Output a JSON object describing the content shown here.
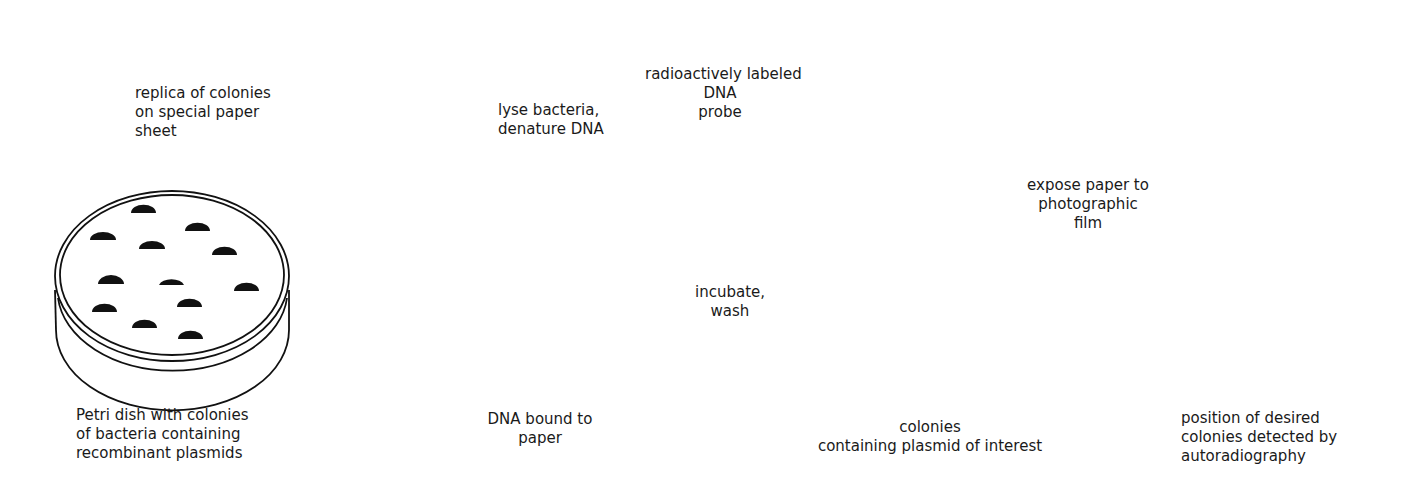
{
  "colors": {
    "ink": "#111111",
    "background": "#ffffff"
  },
  "steps": [
    {
      "id": "petri-dish",
      "label": "Petri dish with colonies\nof bacteria containing\nrecombinant plasmids"
    },
    {
      "id": "replica",
      "label": "replica of colonies\non special paper\nsheet"
    },
    {
      "id": "lyse",
      "label": "lyse bacteria,\ndenature DNA"
    },
    {
      "id": "dna-bound",
      "label": "DNA bound to\npaper"
    },
    {
      "id": "probe",
      "label": "radioactively labeled\nDNA\nprobe"
    },
    {
      "id": "incubate",
      "label": "incubate,\nwash"
    },
    {
      "id": "positive-colonies",
      "label": "colonies\ncontaining plasmid of interest"
    },
    {
      "id": "expose",
      "label": "expose paper to\nphotographic\nfilm"
    },
    {
      "id": "result",
      "label": "position of desired\ncolonies detected by\nautoradiography"
    }
  ],
  "counts": {
    "petri_colonies": 12,
    "replica_colonies": 12,
    "paper_dna_spots": 12,
    "hybridized_paper_spots": 12,
    "highlighted_positive_colonies": 2,
    "autoradiograph_spots": 2
  }
}
